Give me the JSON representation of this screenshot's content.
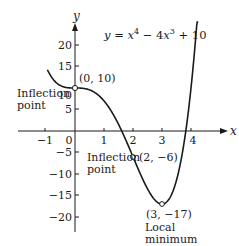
{
  "chart_data": {
    "type": "line",
    "title": "",
    "equation": "y = x⁴ − 4x³ + 10",
    "equation_parts": {
      "lhs": "y",
      "eq": " = ",
      "x1": "x",
      "p1": "4",
      "minus": " − 4",
      "x2": "x",
      "p2": "3",
      "plus": " + 10"
    },
    "xlabel": "x",
    "ylabel": "y",
    "xlim": [
      -1.6,
      4.9
    ],
    "ylim": [
      -24,
      26
    ],
    "x_ticks": [
      -1,
      0,
      1,
      2,
      3,
      4
    ],
    "x_tick_labels": [
      "−1",
      "0",
      "1",
      "2",
      "3",
      "4"
    ],
    "y_ticks": [
      20,
      15,
      10,
      5,
      -5,
      -10,
      -15,
      -20
    ],
    "y_tick_labels": [
      "20",
      "15",
      "10",
      "5",
      "−5",
      "−10",
      "−15",
      "−20"
    ],
    "grid": false,
    "series": [
      {
        "name": "y = x^4 - 4x^3 + 10",
        "function": "x^4 - 4*x^3 + 10",
        "x_range": [
          -0.95,
          4.25
        ],
        "x": [
          -0.9,
          -0.5,
          0,
          0.5,
          1,
          1.5,
          2,
          2.5,
          3,
          3.5,
          4,
          4.25
        ],
        "values": [
          13.57,
          10.56,
          10,
          9.56,
          7,
          1.56,
          -6,
          -12.97,
          -17,
          -11.44,
          10,
          30.6
        ]
      }
    ],
    "annotations": [
      {
        "point": [
          0,
          10
        ],
        "label": "(0, 10)",
        "note": "Inflection point"
      },
      {
        "point": [
          2,
          -6
        ],
        "label": "(2, −6)",
        "note": "Inflection point"
      },
      {
        "point": [
          3,
          -17
        ],
        "label": "(3, −17)",
        "note": "Local minimum"
      }
    ]
  },
  "labels": {
    "axis_x": "x",
    "axis_y": "y",
    "eq": {
      "lhs": "y",
      "mid": " = ",
      "x1": "x",
      "p1": "4",
      "minus": " − 4",
      "x2": "x",
      "p2": "3",
      "plus": " + 10"
    },
    "ticks_x": [
      "−1",
      "0",
      "1",
      "2",
      "3",
      "4"
    ],
    "ticks_y": [
      "20",
      "15",
      "10",
      "5",
      "−5",
      "−10",
      "−15",
      "−20"
    ],
    "pt1": "(0, 10)",
    "pt1_note_line1": "Inflection",
    "pt1_note_line2": "point",
    "pt2": "(2, −6)",
    "pt2_note_line1": "Inflection",
    "pt2_note_line2": "point",
    "pt3": "(3, −17)",
    "pt3_note_line1": "Local",
    "pt3_note_line2": "minimum"
  },
  "colors": {
    "ink": "#1a1a1a",
    "background": "#ffffff"
  }
}
